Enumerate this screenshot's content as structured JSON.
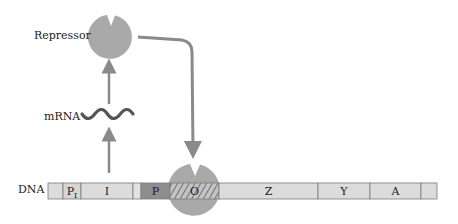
{
  "diagram": {
    "title": "",
    "labels": {
      "repressor": "Repressor",
      "mrna": "mRNA",
      "dna": "DNA"
    },
    "dna_segments": [
      {
        "id": "lead",
        "label": "",
        "x": 48,
        "w": 15,
        "fill": "#dcdcdc"
      },
      {
        "id": "PI",
        "label": "P",
        "subscript": "I",
        "x": 63,
        "w": 18,
        "fill": "#d6d6d6"
      },
      {
        "id": "I",
        "label": "I",
        "x": 81,
        "w": 52,
        "fill": "#dcdcdc"
      },
      {
        "id": "gap",
        "label": "",
        "x": 133,
        "w": 8,
        "fill": "#e2e2e2"
      },
      {
        "id": "P",
        "label": "P",
        "x": 141,
        "w": 29,
        "fill": "#8e8e8e"
      },
      {
        "id": "O",
        "label": "O",
        "x": 170,
        "w": 49,
        "fill": "#c8c8c8",
        "hatched": true
      },
      {
        "id": "Z",
        "label": "Z",
        "x": 219,
        "w": 99,
        "fill": "#dcdcdc"
      },
      {
        "id": "Y",
        "label": "Y",
        "x": 318,
        "w": 52,
        "fill": "#dcdcdc"
      },
      {
        "id": "A",
        "label": "A",
        "x": 370,
        "w": 51,
        "fill": "#dcdcdc"
      },
      {
        "id": "tail",
        "label": "",
        "x": 421,
        "w": 16,
        "fill": "#dcdcdc"
      }
    ],
    "colors": {
      "repressor": "#a9a9a9",
      "arrow": "#8a8a8a",
      "segment_border": "#7a7a7a",
      "mrna_wave": "#555555"
    }
  }
}
